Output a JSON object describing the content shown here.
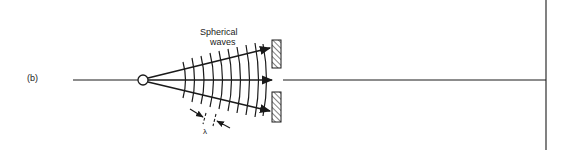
{
  "figure": {
    "panel_label": "(b)",
    "annotation_title_line1": "Spherical",
    "annotation_title_line2": "waves",
    "wavelength_symbol": "λ"
  },
  "colors": {
    "ink": "#1a1a1a",
    "background": "#ffffff"
  },
  "geometry": {
    "source": {
      "x": 143,
      "y": 80,
      "r": 5
    },
    "axis_y": 80,
    "wavefront_count": 10,
    "barriers": [
      {
        "name": "upper-barrier",
        "x": 272,
        "y": 40,
        "w": 9,
        "h": 28
      },
      {
        "name": "lower-barrier",
        "x": 272,
        "y": 92,
        "w": 9,
        "h": 30
      }
    ],
    "screen_x": 546
  }
}
